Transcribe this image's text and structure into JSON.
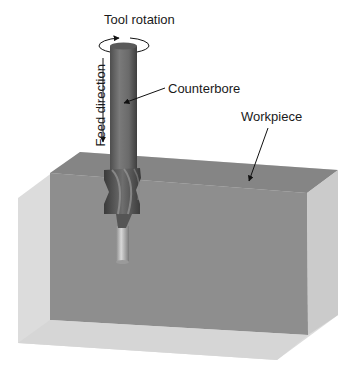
{
  "labels": {
    "tool_rotation": "Tool rotation",
    "counterbore": "Counterbore",
    "workpiece": "Workpiece",
    "feed_direction": "Feed direction"
  },
  "colors": {
    "workpiece_light": "#d9d9d9",
    "workpiece_dark": "#8c8c8c",
    "workpiece_top": "#888888",
    "workpiece_right": "#cfcfcf",
    "tool_shank": "#6a6a6a",
    "tool_cutter": "#4a4a4a",
    "pilot": "#b0b0b0"
  }
}
